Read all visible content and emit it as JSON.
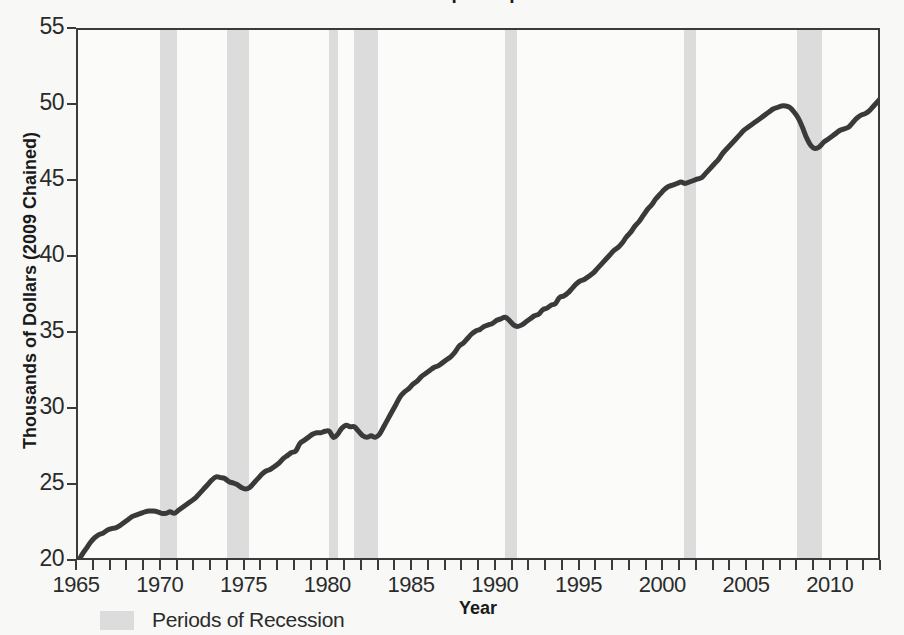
{
  "chart_data": {
    "type": "line",
    "title": "Real GDP per Capita",
    "xlabel": "Year",
    "ylabel": "Thousands of Dollars (2009 Chained)",
    "xlim": [
      1965,
      2013
    ],
    "ylim": [
      20,
      55
    ],
    "x_ticks_major": [
      1965,
      1970,
      1975,
      1980,
      1985,
      1990,
      1995,
      2000,
      2005,
      2010
    ],
    "x_tick_interval_minor": 1,
    "y_ticks": [
      20,
      25,
      30,
      35,
      40,
      45,
      50,
      55
    ],
    "grid": false,
    "legend_position": "below-left",
    "series": [
      {
        "name": "Real GDP per Capita",
        "color": "#3a3a3a",
        "line_width": 5,
        "x": [
          1965.0,
          1965.25,
          1965.5,
          1965.75,
          1966.0,
          1966.25,
          1966.5,
          1966.75,
          1967.0,
          1967.25,
          1967.5,
          1967.75,
          1968.0,
          1968.25,
          1968.5,
          1968.75,
          1969.0,
          1969.25,
          1969.5,
          1969.75,
          1970.0,
          1970.25,
          1970.5,
          1970.75,
          1971.0,
          1971.25,
          1971.5,
          1971.75,
          1972.0,
          1972.25,
          1972.5,
          1972.75,
          1973.0,
          1973.25,
          1973.5,
          1973.75,
          1974.0,
          1974.25,
          1974.5,
          1974.75,
          1975.0,
          1975.25,
          1975.5,
          1975.75,
          1976.0,
          1976.25,
          1976.5,
          1976.75,
          1977.0,
          1977.25,
          1977.5,
          1977.75,
          1978.0,
          1978.25,
          1978.5,
          1978.75,
          1979.0,
          1979.25,
          1979.5,
          1979.75,
          1980.0,
          1980.25,
          1980.5,
          1980.75,
          1981.0,
          1981.25,
          1981.5,
          1981.75,
          1982.0,
          1982.25,
          1982.5,
          1982.75,
          1983.0,
          1983.25,
          1983.5,
          1983.75,
          1984.0,
          1984.25,
          1984.5,
          1984.75,
          1985.0,
          1985.25,
          1985.5,
          1985.75,
          1986.0,
          1986.25,
          1986.5,
          1986.75,
          1987.0,
          1987.25,
          1987.5,
          1987.75,
          1988.0,
          1988.25,
          1988.5,
          1988.75,
          1989.0,
          1989.25,
          1989.5,
          1989.75,
          1990.0,
          1990.25,
          1990.5,
          1990.75,
          1991.0,
          1991.25,
          1991.5,
          1991.75,
          1992.0,
          1992.25,
          1992.5,
          1992.75,
          1993.0,
          1993.25,
          1993.5,
          1993.75,
          1994.0,
          1994.25,
          1994.5,
          1994.75,
          1995.0,
          1995.25,
          1995.5,
          1995.75,
          1996.0,
          1996.25,
          1996.5,
          1996.75,
          1997.0,
          1997.25,
          1997.5,
          1997.75,
          1998.0,
          1998.25,
          1998.5,
          1998.75,
          1999.0,
          1999.25,
          1999.5,
          1999.75,
          2000.0,
          2000.25,
          2000.5,
          2000.75,
          2001.0,
          2001.25,
          2001.5,
          2001.75,
          2002.0,
          2002.25,
          2002.5,
          2002.75,
          2003.0,
          2003.25,
          2003.5,
          2003.75,
          2004.0,
          2004.25,
          2004.5,
          2004.75,
          2005.0,
          2005.25,
          2005.5,
          2005.75,
          2006.0,
          2006.25,
          2006.5,
          2006.75,
          2007.0,
          2007.25,
          2007.5,
          2007.75,
          2008.0,
          2008.25,
          2008.5,
          2008.75,
          2009.0,
          2009.25,
          2009.5,
          2009.75,
          2010.0,
          2010.25,
          2010.5,
          2010.75,
          2011.0,
          2011.25,
          2011.5,
          2011.75,
          2012.0,
          2012.25,
          2012.5,
          2012.75,
          2013.0
        ],
        "values": [
          20.0,
          20.5,
          20.9,
          21.3,
          21.6,
          21.8,
          21.9,
          22.1,
          22.2,
          22.25,
          22.4,
          22.6,
          22.8,
          23.0,
          23.1,
          23.2,
          23.3,
          23.35,
          23.35,
          23.3,
          23.2,
          23.2,
          23.3,
          23.2,
          23.4,
          23.6,
          23.8,
          24.0,
          24.2,
          24.5,
          24.8,
          25.1,
          25.4,
          25.6,
          25.55,
          25.5,
          25.3,
          25.2,
          25.1,
          24.9,
          24.8,
          24.9,
          25.2,
          25.5,
          25.8,
          26.0,
          26.1,
          26.3,
          26.5,
          26.8,
          27.0,
          27.2,
          27.3,
          27.8,
          28.0,
          28.2,
          28.4,
          28.5,
          28.5,
          28.6,
          28.6,
          28.2,
          28.4,
          28.8,
          29.0,
          28.9,
          28.9,
          28.6,
          28.3,
          28.2,
          28.3,
          28.2,
          28.4,
          28.9,
          29.4,
          29.9,
          30.4,
          30.9,
          31.2,
          31.4,
          31.7,
          31.9,
          32.2,
          32.4,
          32.6,
          32.8,
          32.9,
          33.1,
          33.3,
          33.5,
          33.8,
          34.2,
          34.4,
          34.7,
          35.0,
          35.2,
          35.3,
          35.5,
          35.6,
          35.7,
          35.9,
          36.0,
          36.1,
          35.9,
          35.6,
          35.5,
          35.6,
          35.8,
          36.0,
          36.2,
          36.3,
          36.6,
          36.7,
          36.9,
          37.0,
          37.4,
          37.5,
          37.7,
          38.0,
          38.3,
          38.5,
          38.6,
          38.8,
          39.0,
          39.3,
          39.6,
          39.9,
          40.2,
          40.5,
          40.7,
          41.0,
          41.4,
          41.7,
          42.1,
          42.4,
          42.8,
          43.2,
          43.5,
          43.9,
          44.2,
          44.5,
          44.7,
          44.8,
          44.9,
          45.0,
          44.9,
          45.0,
          45.1,
          45.2,
          45.3,
          45.6,
          45.9,
          46.2,
          46.5,
          46.9,
          47.2,
          47.5,
          47.8,
          48.1,
          48.4,
          48.6,
          48.8,
          49.0,
          49.2,
          49.4,
          49.6,
          49.8,
          49.9,
          50.0,
          50.0,
          49.9,
          49.6,
          49.2,
          48.6,
          47.9,
          47.4,
          47.2,
          47.3,
          47.6,
          47.8,
          48.0,
          48.2,
          48.4,
          48.5,
          48.6,
          48.9,
          49.2,
          49.4,
          49.5,
          49.7,
          50.0,
          50.3,
          50.6
        ]
      }
    ],
    "recession_bands": [
      {
        "start": 1969.9,
        "end": 1970.9
      },
      {
        "start": 1973.9,
        "end": 1975.2
      },
      {
        "start": 1980.0,
        "end": 1980.5
      },
      {
        "start": 1981.5,
        "end": 1982.9
      },
      {
        "start": 1990.5,
        "end": 1991.2
      },
      {
        "start": 2001.2,
        "end": 2001.9
      },
      {
        "start": 2007.9,
        "end": 2009.4
      }
    ],
    "legend": [
      {
        "label": "Periods of Recession",
        "color": "#dcdcdc",
        "type": "band"
      }
    ]
  },
  "colors": {
    "line": "#3a3a3a",
    "recession_band": "#dcdcdc",
    "axis": "#3b3b3b",
    "background": "#f8f8f6",
    "plot_background": "#fbfbfa"
  }
}
